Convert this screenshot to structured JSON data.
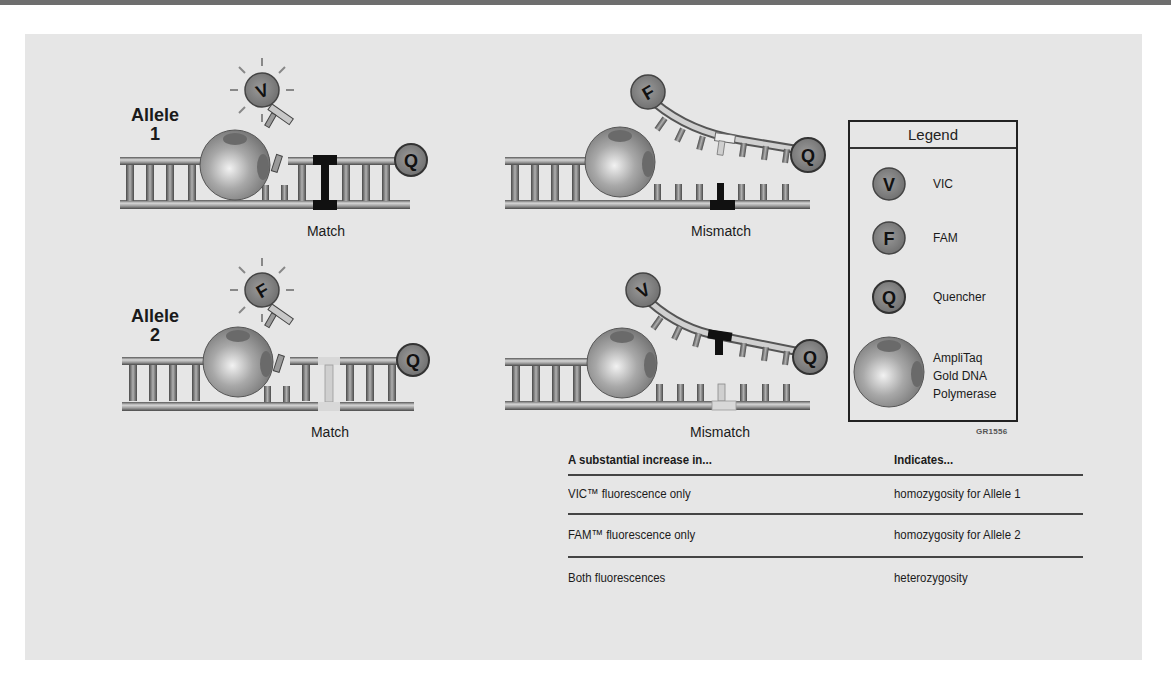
{
  "figure": {
    "id_label": "GR1556",
    "colors": {
      "background": "#e6e6e6",
      "strand": "#8a8a8a",
      "strand_dark": "#4a4a4a",
      "dye_fill": "#7d7d7d",
      "match_marker": "#111111",
      "mismatch_marker": "#d8d8d8"
    }
  },
  "panels": [
    {
      "name": "allele-1-match",
      "allele_label": "Allele",
      "allele_number": "1",
      "caption": "Match",
      "released_dye": "V",
      "probe_dye": "V",
      "quencher": "Q",
      "marker_type": "match-dark"
    },
    {
      "name": "allele-1-mismatch",
      "caption": "Mismatch",
      "probe_dye": "F",
      "quencher": "Q",
      "marker_type": "mismatch-dark"
    },
    {
      "name": "allele-2-match",
      "allele_label": "Allele",
      "allele_number": "2",
      "caption": "Match",
      "released_dye": "F",
      "probe_dye": "F",
      "quencher": "Q",
      "marker_type": "match-light"
    },
    {
      "name": "allele-2-mismatch",
      "caption": "Mismatch",
      "probe_dye": "V",
      "quencher": "Q",
      "marker_type": "mismatch-light"
    }
  ],
  "legend": {
    "title": "Legend",
    "items": [
      {
        "symbol": "V",
        "label": "VIC"
      },
      {
        "symbol": "F",
        "label": "FAM"
      },
      {
        "symbol": "Q",
        "label": "Quencher"
      },
      {
        "symbol": "polymerase",
        "label_lines": [
          "AmpliTaq",
          "Gold DNA",
          "Polymerase"
        ]
      }
    ]
  },
  "table": {
    "headers": [
      "A substantial increase in...",
      "Indicates..."
    ],
    "rows": [
      [
        "VIC™ fluorescence only",
        "homozygosity for Allele 1"
      ],
      [
        "FAM™ fluorescence only",
        "homozygosity for Allele 2"
      ],
      [
        "Both fluorescences",
        "heterozygosity"
      ]
    ]
  }
}
